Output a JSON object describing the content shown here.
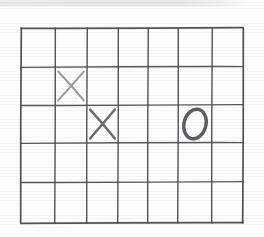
{
  "canvas": {
    "width": 264,
    "height": 237,
    "background_color": "#fefefe",
    "description": "Hand-drawn grid game board on paper"
  },
  "top_band": {
    "name": "scanned-edge-band",
    "color": "#e5e5e8",
    "x": 0,
    "y": 0,
    "width": 250,
    "height": 7
  },
  "board": {
    "title": "hand-drawn-grid",
    "columns": 7,
    "rows": 5,
    "left": 21,
    "top": 28,
    "right": 243,
    "bottom": 223,
    "line_color": "#4a4a4c",
    "vertical_line_x": [
      21,
      55,
      87,
      118,
      148,
      178,
      212,
      243
    ],
    "horizontal_line_y": [
      28,
      67,
      105,
      143,
      182,
      223
    ]
  },
  "marks": [
    {
      "name": "mark-x-r2c2",
      "symbol": "X",
      "row": 2,
      "column": 2,
      "color": "#9b9b9d",
      "weight": "light",
      "cell_x0": 55,
      "cell_x1": 87,
      "cell_y0": 67,
      "cell_y1": 105,
      "stroke_a": "M 58 71 L 81 100",
      "stroke_b": "M 81 72 L 58 101"
    },
    {
      "name": "mark-x-r3c3",
      "symbol": "X",
      "row": 3,
      "column": 3,
      "color": "#6d6d70",
      "weight": "dark",
      "cell_x0": 87,
      "cell_x1": 118,
      "cell_y0": 105,
      "cell_y1": 143,
      "stroke_a": "M 90 110 L 115 140",
      "stroke_b": "M 115 110 L 90 140"
    },
    {
      "name": "mark-o-r3c6",
      "symbol": "O",
      "row": 3,
      "column": 6,
      "color": "#5e5e62",
      "weight": "dark",
      "cell_x0": 178,
      "cell_x1": 212,
      "cell_y0": 105,
      "cell_y1": 143,
      "ellipse_cx": 195,
      "ellipse_cy": 124,
      "ellipse_rx": 11,
      "ellipse_ry": 15,
      "rotation_deg": 14
    }
  ]
}
